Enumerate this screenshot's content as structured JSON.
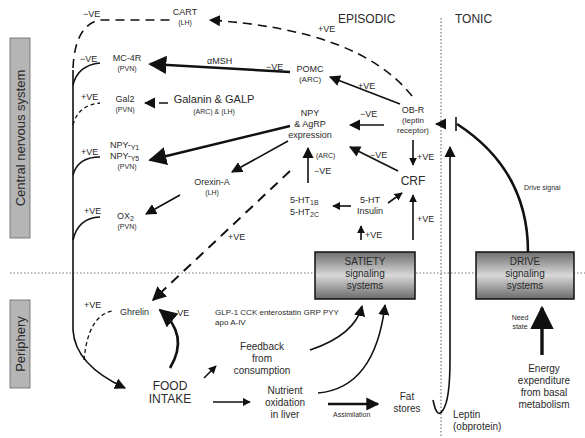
{
  "sections": {
    "cns_label": "Central nervous system",
    "periphery_label": "Periphery",
    "episodic": "EPISODIC",
    "tonic": "TONIC"
  },
  "nodes": {
    "cart": {
      "name": "CART",
      "loc": "(LH)"
    },
    "mc4r": {
      "name": "MC-4R",
      "loc": "(PVN)"
    },
    "gal2": {
      "name": "Gal2",
      "loc": "(PVN)"
    },
    "npy_y": {
      "line1": "NPY-",
      "sub1": "Y1",
      "line2": "NPY-",
      "sub2": "Y5",
      "loc": "(PVN)"
    },
    "ox2": {
      "name": "OX",
      "sub": "2",
      "loc": "(PVN)"
    },
    "pomc": {
      "name": "POMC",
      "loc": "(ARC)"
    },
    "galanin": {
      "name": "Galanin & GALP",
      "loc": "(ARC) & (LH)"
    },
    "npy_agrp": {
      "line1": "NPY",
      "line2": "& AgRP",
      "line3": "expression",
      "loc": "(ARC)"
    },
    "orexin": {
      "name": "Orexin-A",
      "loc": "(LH)"
    },
    "obr": {
      "line1": "OB-R",
      "line2": "(leptin",
      "line3": "receptor)"
    },
    "crf": {
      "name": "CRF"
    },
    "ht": {
      "line1": "5-HT",
      "sub1": "1B",
      "line2": "5-HT",
      "sub2": "2C"
    },
    "ht_insulin": {
      "line1": "5-HT",
      "line2": "Insulin"
    },
    "satiety": {
      "line1": "SATIETY",
      "line2": "signaling",
      "line3": "systems"
    },
    "drive": {
      "line1": "DRIVE",
      "line2": "signaling",
      "line3": "systems"
    },
    "ghrelin": {
      "name": "Ghrelin"
    },
    "food_intake": {
      "line1": "FOOD",
      "line2": "INTAKE"
    },
    "gut_peptides": {
      "line1": "GLP-1 CCK enterostatin GRP PYY",
      "line2": "apo A-IV"
    },
    "feedback": {
      "line1": "Feedback",
      "line2": "from",
      "line3": "consumption"
    },
    "nutrient": {
      "line1": "Nutrient",
      "line2": "oxidation",
      "line3": "in liver"
    },
    "fat": {
      "line1": "Fat",
      "line2": "stores"
    },
    "leptin": {
      "line1": "Leptin",
      "line2": "(obprotein)"
    },
    "energy": {
      "line1": "Energy",
      "line2": "expenditure",
      "line3": "from basal",
      "line4": "metabolism"
    }
  },
  "edge_labels": {
    "neg": "−VE",
    "pos": "+VE",
    "amsh": "αMSH",
    "drive_signal": "Drive signal",
    "need_state": {
      "line1": "Need",
      "line2": "state"
    },
    "assimilation": "Assimilation"
  },
  "colors": {
    "box_fill_light": "#d8d8d8",
    "box_fill_dark": "#6e6e6e",
    "side_label_fill": "#b5b5b5",
    "line": "#111111",
    "divider": "#777777"
  }
}
